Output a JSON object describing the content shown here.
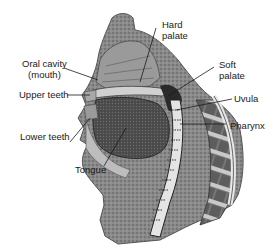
{
  "diagram": {
    "type": "anatomical-sagittal-section",
    "labels": {
      "hard_palate_1": "Hard",
      "hard_palate_2": "palate",
      "oral_cavity_1": "Oral cavity",
      "oral_cavity_2": "(mouth)",
      "soft_palate_1": "Soft",
      "soft_palate_2": "palate",
      "upper_teeth": "Upper teeth",
      "uvula": "Uvula",
      "lower_teeth": "Lower teeth",
      "pharynx": "Pharynx",
      "tongue": "Tongue"
    },
    "colors": {
      "tissue_dark": "#3a3a3a",
      "tissue_mid": "#7a7a7a",
      "tissue_light": "#b5b5b5",
      "leader_line": "#1a1a1a",
      "background": "#ffffff"
    }
  }
}
